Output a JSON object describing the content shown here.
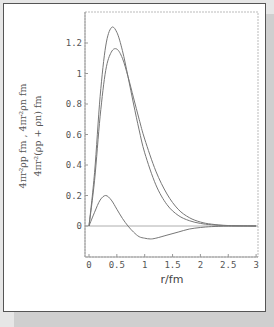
{
  "chart_data": {
    "type": "line",
    "title": "",
    "xlabel": "r/fm",
    "ylabel_line1": "4πr²ρp fm , 4πr²ρn fm",
    "ylabel_line2": "4πr²(ρp + ρn) fm",
    "xlim": [
      0,
      3
    ],
    "ylim": [
      -0.15,
      1.38
    ],
    "x_ticks": [
      "0",
      "0.5",
      "1",
      "1.5",
      "2",
      "2.5",
      "3"
    ],
    "y_ticks": [
      "0",
      "0.2",
      "0.4",
      "0.6",
      "0.8",
      "1",
      "1.2"
    ],
    "grid": false,
    "legend": "none",
    "series": [
      {
        "name": "upper curve (peak ≈1.30)",
        "x": [
          0,
          0.1,
          0.2,
          0.3,
          0.4,
          0.5,
          0.6,
          0.7,
          0.8,
          0.9,
          1.0,
          1.2,
          1.4,
          1.6,
          1.8,
          2.0,
          2.2,
          2.5,
          3.0
        ],
        "values": [
          0,
          0.35,
          0.85,
          1.18,
          1.3,
          1.27,
          1.15,
          0.98,
          0.8,
          0.63,
          0.48,
          0.27,
          0.14,
          0.07,
          0.035,
          0.017,
          0.008,
          0.002,
          0
        ]
      },
      {
        "name": "lower curve (peak ≈1.16)",
        "x": [
          0,
          0.1,
          0.2,
          0.3,
          0.4,
          0.5,
          0.6,
          0.7,
          0.8,
          0.9,
          1.0,
          1.2,
          1.4,
          1.6,
          1.8,
          2.0,
          2.2,
          2.5,
          3.0
        ],
        "values": [
          0,
          0.3,
          0.72,
          1.02,
          1.14,
          1.16,
          1.1,
          0.98,
          0.84,
          0.7,
          0.57,
          0.36,
          0.21,
          0.11,
          0.055,
          0.026,
          0.012,
          0.003,
          0
        ]
      },
      {
        "name": "difference curve",
        "x": [
          0,
          0.1,
          0.2,
          0.3,
          0.4,
          0.5,
          0.6,
          0.7,
          0.8,
          0.9,
          1.0,
          1.1,
          1.2,
          1.4,
          1.6,
          1.8,
          2.0,
          2.2,
          2.5,
          3.0
        ],
        "values": [
          0,
          0.09,
          0.17,
          0.2,
          0.17,
          0.11,
          0.05,
          0.0,
          -0.04,
          -0.07,
          -0.08,
          -0.085,
          -0.08,
          -0.06,
          -0.04,
          -0.02,
          -0.01,
          -0.004,
          -0.001,
          0
        ]
      }
    ]
  },
  "colors": {
    "curve": "#777777",
    "axis": "#888888",
    "frame": "#aaaaaa"
  }
}
